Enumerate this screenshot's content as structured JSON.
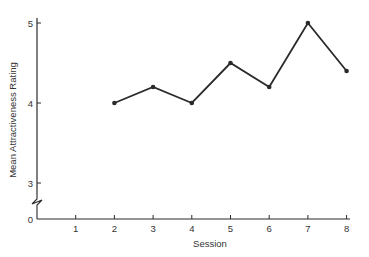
{
  "chart_data": {
    "type": "line",
    "title": "",
    "xlabel": "Session",
    "ylabel": "Mean Attractiveness Rating",
    "x_ticks": [
      1,
      2,
      3,
      4,
      5,
      6,
      7,
      8
    ],
    "y_ticks": [
      0,
      3,
      4,
      5
    ],
    "y_axis_break": "between 0 and 3",
    "ylim": [
      3,
      5
    ],
    "xlim": [
      0,
      8
    ],
    "grid": false,
    "legend": null,
    "series": [
      {
        "name": "Mean Attractiveness Rating",
        "x": [
          2,
          3,
          4,
          5,
          6,
          7,
          8
        ],
        "values": [
          4.0,
          4.2,
          4.0,
          4.5,
          4.2,
          5.0,
          4.4
        ]
      }
    ]
  },
  "labels": {
    "xlabel": "Session",
    "ylabel": "Mean Attractiveness Rating"
  }
}
